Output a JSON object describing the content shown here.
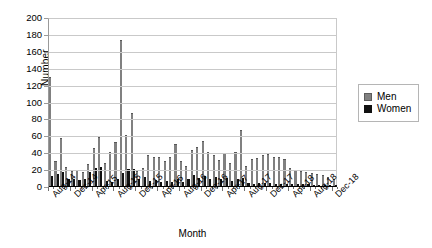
{
  "chart_data": {
    "type": "bar",
    "title": "",
    "xlabel": "Month",
    "ylabel": "Number",
    "ylim": [
      0,
      200
    ],
    "ytick_step": 20,
    "yticks": [
      0,
      20,
      40,
      60,
      80,
      100,
      120,
      140,
      160,
      180,
      200
    ],
    "grid": "horizontal",
    "legend_position": "right",
    "grouping": "clustered",
    "categories": [
      "Aug-14",
      "Sep-14",
      "Oct-14",
      "Nov-14",
      "Dec-14",
      "Jan-15",
      "Feb-15",
      "Mar-15",
      "Apr-15",
      "May-15",
      "Jun-15",
      "Jul-15",
      "Aug-15",
      "Sep-15",
      "Oct-15",
      "Nov-15",
      "Dec-15",
      "Jan-16",
      "Feb-16",
      "Mar-16",
      "Apr-16",
      "May-16",
      "Jun-16",
      "Jul-16",
      "Aug-16",
      "Sep-16",
      "Oct-16",
      "Nov-16",
      "Dec-16",
      "Jan-17",
      "Feb-17",
      "Mar-17",
      "Apr-17",
      "May-17",
      "Jun-17",
      "Jul-17",
      "Aug-17",
      "Sep-17",
      "Oct-17",
      "Nov-17",
      "Dec-17",
      "Jan-18",
      "Feb-18",
      "Mar-18",
      "Apr-18",
      "May-18",
      "Jun-18",
      "Jul-18",
      "Aug-18",
      "Sep-18",
      "Oct-18",
      "Nov-18",
      "Dec-18"
    ],
    "labeled_ticks": [
      "Aug-14",
      "Dec-14",
      "Apr-15",
      "Aug-15",
      "Dec-15",
      "Apr-16",
      "Aug-16",
      "Dec-16",
      "Apr-17",
      "Aug-17",
      "Dec-17",
      "Apr-18",
      "Aug-18",
      "Dec-18"
    ],
    "series": [
      {
        "name": "Men",
        "color": "#808080",
        "values": [
          130,
          31,
          58,
          24,
          19,
          20,
          18,
          27,
          46,
          59,
          29,
          41,
          53,
          174,
          62,
          88,
          19,
          22,
          38,
          35,
          36,
          31,
          36,
          51,
          31,
          25,
          44,
          47,
          55,
          42,
          38,
          32,
          40,
          28,
          42,
          68,
          25,
          33,
          34,
          38,
          39,
          36,
          35,
          33,
          22,
          20,
          19,
          18,
          17,
          15,
          14,
          12,
          10
        ]
      },
      {
        "name": "Women",
        "color": "#111111",
        "values": [
          13,
          15,
          18,
          10,
          9,
          8,
          10,
          18,
          22,
          24,
          7,
          6,
          9,
          17,
          21,
          21,
          9,
          12,
          7,
          8,
          6,
          7,
          6,
          9,
          6,
          9,
          14,
          11,
          13,
          10,
          12,
          9,
          11,
          7,
          9,
          11,
          5,
          4,
          5,
          5,
          5,
          4,
          4,
          4,
          3,
          3,
          3,
          3,
          2,
          2,
          2,
          2,
          2
        ]
      }
    ]
  },
  "legend": {
    "items": [
      {
        "label": "Men"
      },
      {
        "label": "Women"
      }
    ]
  }
}
